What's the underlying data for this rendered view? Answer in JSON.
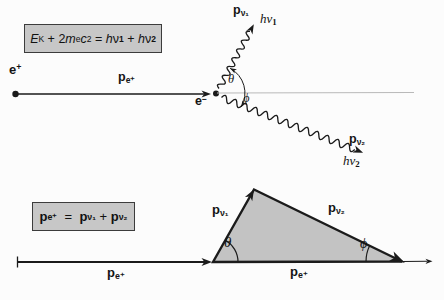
{
  "colors": {
    "background": "#fcfcfc",
    "line": "#1b1b1b",
    "reference_line": "#b9b9b9",
    "box_fill": "#c7c7c7",
    "box_border": "#3c3c3c",
    "triangle_fill": "#c3c3c3"
  },
  "energy_equation": {
    "segments": [
      {
        "t": "E",
        "s": "i"
      },
      {
        "t": "K",
        "s": "sub"
      },
      {
        "t": " + 2",
        "s": "n"
      },
      {
        "t": "m",
        "s": "i"
      },
      {
        "t": "e",
        "s": "sub"
      },
      {
        "t": "c",
        "s": "i"
      },
      {
        "t": "2",
        "s": "sup"
      },
      {
        "t": " = ",
        "s": "n"
      },
      {
        "t": "h",
        "s": "i"
      },
      {
        "t": "ν",
        "s": "n"
      },
      {
        "t": "1",
        "s": "bsub"
      },
      {
        "t": " + ",
        "s": "n"
      },
      {
        "t": "h",
        "s": "i"
      },
      {
        "t": "ν",
        "s": "n"
      },
      {
        "t": "2",
        "s": "bsub"
      }
    ]
  },
  "momentum_equation": {
    "segments": [
      {
        "t": "p",
        "s": "b"
      },
      {
        "t": "e⁺",
        "s": "bsub"
      },
      {
        "t": "  =  ",
        "s": "n"
      },
      {
        "t": "p",
        "s": "b"
      },
      {
        "t": "ν₁",
        "s": "bsub"
      },
      {
        "t": " + ",
        "s": "n"
      },
      {
        "t": "p",
        "s": "b"
      },
      {
        "t": "ν₂",
        "s": "bsub"
      }
    ]
  },
  "labels": {
    "positron": {
      "segments": [
        {
          "t": "e",
          "s": "b"
        },
        {
          "t": "+",
          "s": "bsup"
        }
      ]
    },
    "electron": {
      "segments": [
        {
          "t": "e",
          "s": "b"
        },
        {
          "t": "−",
          "s": "bsup"
        }
      ]
    },
    "p_e_plus": {
      "segments": [
        {
          "t": "p",
          "s": "b"
        },
        {
          "t": "e⁺",
          "s": "bsub"
        }
      ]
    },
    "p_nu1": {
      "segments": [
        {
          "t": "p",
          "s": "b"
        },
        {
          "t": "ν₁",
          "s": "bsub"
        }
      ]
    },
    "p_nu2": {
      "segments": [
        {
          "t": "p",
          "s": "b"
        },
        {
          "t": "ν₂",
          "s": "bsub"
        }
      ]
    },
    "h_nu1": {
      "segments": [
        {
          "t": "hν",
          "s": "i"
        },
        {
          "t": "1",
          "s": "bsub"
        }
      ]
    },
    "h_nu2": {
      "segments": [
        {
          "t": "hν",
          "s": "i"
        },
        {
          "t": "2",
          "s": "bsub"
        }
      ]
    },
    "theta": {
      "segments": [
        {
          "t": "θ",
          "s": "i"
        }
      ]
    },
    "phi": {
      "segments": [
        {
          "t": "ϕ",
          "s": "i"
        }
      ]
    }
  }
}
